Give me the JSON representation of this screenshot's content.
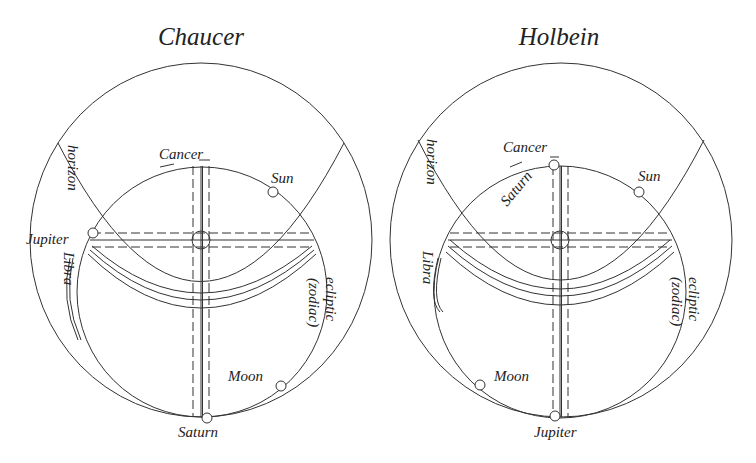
{
  "figure": {
    "panels": [
      {
        "title": "Chaucer",
        "labels": {
          "horizon": "horizon",
          "cancer": "Cancer",
          "sun": "Sun",
          "jupiter": "Jupiter",
          "libra": "Libra",
          "ecliptic": "ecliptic",
          "zodiac": "(zodiac)",
          "moon": "Moon",
          "saturn": "Saturn"
        }
      },
      {
        "title": "Holbein",
        "labels": {
          "horizon": "horizon",
          "cancer": "Cancer",
          "saturn": "Saturn",
          "sun": "Sun",
          "libra": "Libra",
          "ecliptic": "ecliptic",
          "zodiac": "(zodiac)",
          "moon": "Moon",
          "jupiter": "Jupiter"
        }
      }
    ],
    "colors": {
      "line": "#333333",
      "text": "#222222",
      "background": "#ffffff"
    }
  }
}
